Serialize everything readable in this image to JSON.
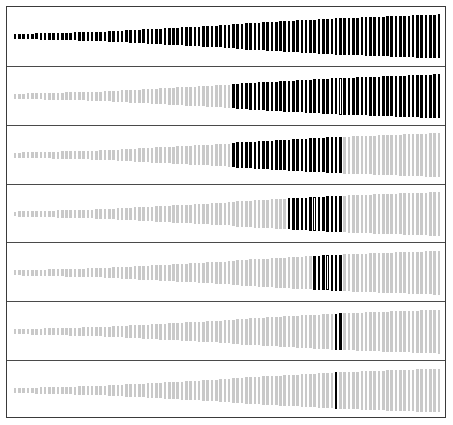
{
  "chart_data": {
    "type": "bar",
    "title": "",
    "subtitle": "",
    "xlabel": "",
    "ylabel": "",
    "grid": false,
    "legend": null,
    "layout": {
      "panels": 7,
      "orientation": "vertical-small-multiples",
      "bar_count": 100,
      "bar_pitch_px": 4.28,
      "bar_width_px": 2.6,
      "plot_left_px": 6,
      "plot_right_px": 434,
      "panel_height_px": 58.85,
      "frame_border_color": "#3a3a3a",
      "separator_color": "#4a4a4a",
      "background": "#ffffff"
    },
    "colors": {
      "selected": "#000000",
      "unselected": "#c9c9c9",
      "highlight_fill": "#ffffff",
      "highlight_stroke": "#000000"
    },
    "categories_note": "100 ordered items, index 0 (left) to 99 (right)",
    "heights_profile": {
      "description": "Bar height grows monotonically left to right in every panel; profile shared across panels.",
      "min_height_frac": 0.09,
      "max_height_frac": 0.8,
      "breaks": [
        {
          "index": 0,
          "height_frac": 0.09
        },
        {
          "index": 20,
          "height_frac": 0.17
        },
        {
          "index": 50,
          "height_frac": 0.42
        },
        {
          "index": 52,
          "height_frac": 0.46
        },
        {
          "index": 75,
          "height_frac": 0.66
        },
        {
          "index": 99,
          "height_frac": 0.8
        }
      ]
    },
    "panels": [
      {
        "id": "panel-1",
        "index": 0,
        "selected_start": 0,
        "selected_end": 99,
        "selected_count": 100,
        "highlight_index": 50,
        "highlight_style": "outline",
        "series_name": "level-1"
      },
      {
        "id": "panel-2",
        "index": 1,
        "selected_start": 51,
        "selected_end": 99,
        "selected_count": 49,
        "highlight_index": 76,
        "highlight_style": "outline",
        "series_name": "level-2"
      },
      {
        "id": "panel-3",
        "index": 2,
        "selected_start": 51,
        "selected_end": 76,
        "selected_count": 26,
        "highlight_index": 64,
        "highlight_style": "outline",
        "series_name": "level-3"
      },
      {
        "id": "panel-4",
        "index": 3,
        "selected_start": 64,
        "selected_end": 76,
        "selected_count": 13,
        "highlight_index": 70,
        "highlight_style": "outline",
        "series_name": "level-4"
      },
      {
        "id": "panel-5",
        "index": 4,
        "selected_start": 70,
        "selected_end": 76,
        "selected_count": 7,
        "highlight_index": 73,
        "highlight_style": "outline",
        "series_name": "level-5"
      },
      {
        "id": "panel-6",
        "index": 5,
        "selected_start": 75,
        "selected_end": 76,
        "selected_count": 2,
        "highlight_index": 75,
        "highlight_style": "outline",
        "series_name": "level-6"
      },
      {
        "id": "panel-7",
        "index": 6,
        "selected_start": 75,
        "selected_end": 75,
        "selected_count": 1,
        "highlight_index": 75,
        "highlight_style": "outline-only",
        "series_name": "level-7"
      }
    ]
  }
}
